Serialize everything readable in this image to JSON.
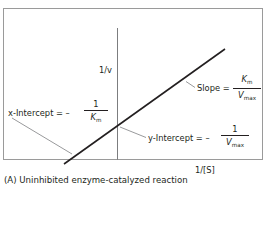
{
  "figure": {
    "axis_y_label": "1/v",
    "axis_x_label": "1/[S]",
    "caption": "(A) Uninhibited enzyme-catalyzed reaction"
  },
  "annotations": {
    "slope": {
      "prefix": "Slope = ",
      "numerator_var": "K",
      "numerator_sub": "m",
      "denominator_var": "V",
      "denominator_sub": "max"
    },
    "x_intercept": {
      "prefix": "x-Intercept = – ",
      "numerator": "1",
      "denominator_var": "K",
      "denominator_sub": "m"
    },
    "y_intercept": {
      "prefix": "y-Intercept = – ",
      "numerator": "1",
      "denominator_var": "V",
      "denominator_sub": "max"
    }
  },
  "colors": {
    "frame": "#9a9a9a",
    "axis": "#6d6e71",
    "plot_line": "#231f20",
    "leader": "#6d6e71",
    "text": "#231f20"
  }
}
